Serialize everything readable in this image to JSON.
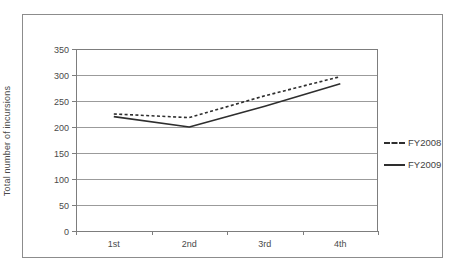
{
  "figure": {
    "y_axis_title": "Total number of incursions"
  },
  "chart_data": {
    "type": "line",
    "categories": [
      "1st",
      "2nd",
      "3rd",
      "4th"
    ],
    "series": [
      {
        "name": "FY2008",
        "style": "dashed",
        "color": "#2e2e2e",
        "values": [
          225,
          218,
          260,
          297
        ]
      },
      {
        "name": "FY2009",
        "style": "solid",
        "color": "#2e2e2e",
        "values": [
          220,
          200,
          240,
          283
        ]
      }
    ],
    "title": "",
    "xlabel": "",
    "ylabel": "Total number of incursions",
    "ylim": [
      0,
      350
    ],
    "ytick_step": 50,
    "yticks": [
      0,
      50,
      100,
      150,
      200,
      250,
      300,
      350
    ],
    "grid": true,
    "legend_position": "right-outside"
  },
  "colors": {
    "outer_border": "#8c8c8c",
    "plot_border": "#7d7d7d",
    "gridline": "#9b9b9b",
    "tick_text": "#4a4a4a",
    "line": "#2e2e2e"
  }
}
